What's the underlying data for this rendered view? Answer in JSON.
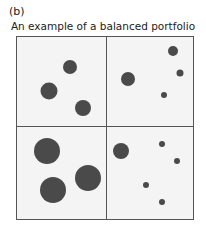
{
  "figure": {
    "label": "(b)",
    "title": "An example of a balanced portfolio"
  },
  "colors": {
    "dot": "#4a4a4a",
    "border": "#555555",
    "background": "#f4f4f4"
  },
  "bubbles": [
    {
      "x": 70,
      "y": 67,
      "d": 14
    },
    {
      "x": 49,
      "y": 91,
      "d": 17
    },
    {
      "x": 83,
      "y": 108,
      "d": 16
    },
    {
      "x": 173,
      "y": 51,
      "d": 10
    },
    {
      "x": 128,
      "y": 79,
      "d": 14
    },
    {
      "x": 180,
      "y": 73,
      "d": 7
    },
    {
      "x": 164,
      "y": 95,
      "d": 6
    },
    {
      "x": 47,
      "y": 151,
      "d": 26
    },
    {
      "x": 53,
      "y": 190,
      "d": 26
    },
    {
      "x": 88,
      "y": 178,
      "d": 26
    },
    {
      "x": 121,
      "y": 151,
      "d": 16
    },
    {
      "x": 162,
      "y": 144,
      "d": 6
    },
    {
      "x": 177,
      "y": 161,
      "d": 6
    },
    {
      "x": 146,
      "y": 185,
      "d": 6
    },
    {
      "x": 162,
      "y": 202,
      "d": 6
    }
  ]
}
